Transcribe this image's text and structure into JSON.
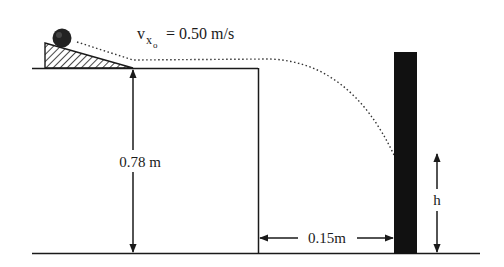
{
  "diagram": {
    "type": "projectile-motion",
    "colors": {
      "ink": "#1a1a1a",
      "wall": "#111111",
      "background": "#ffffff"
    },
    "labels": {
      "velocity_symbol": "v",
      "velocity_sub": "x",
      "velocity_subsub": "o",
      "velocity_value": "= 0.50 m/s",
      "table_height": "0.78 m",
      "distance_to_wall": "0.15m",
      "impact_height": "h"
    },
    "elements": [
      "ball",
      "ramp",
      "table",
      "ground",
      "wall",
      "trajectory"
    ]
  }
}
